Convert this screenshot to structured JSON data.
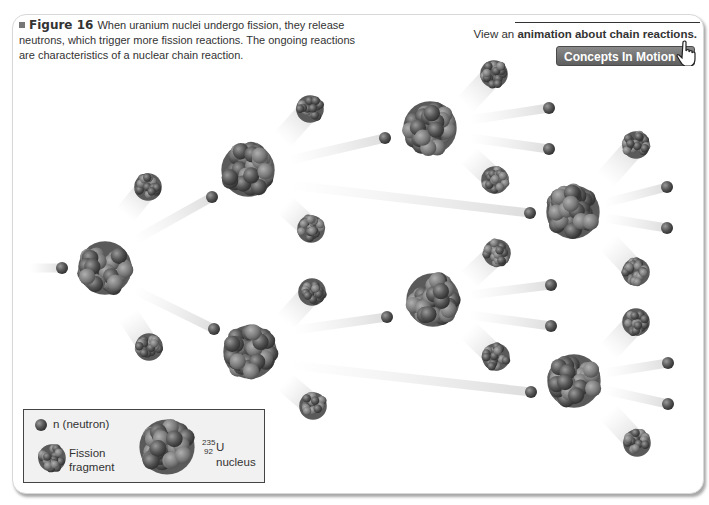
{
  "figure": {
    "label": "Figure 16",
    "caption": "When uranium nuclei undergo fission, they release neutrons, which trigger more fission reactions. The ongoing reactions are characteristics of a nuclear chain reaction."
  },
  "concepts_in_motion": {
    "prefix": "View an ",
    "bold_text": "animation about chain reactions.",
    "button_label": "Concepts In Motion",
    "icon": "hand-pointer-icon"
  },
  "legend": {
    "neutron_label": "n (neutron)",
    "fragment_label_line1": "Fission",
    "fragment_label_line2": "fragment",
    "isotope_mass": "235",
    "isotope_atomic": "92",
    "nucleus_label": "U nucleus"
  },
  "colors": {
    "particle_dark": "#4a4a4a",
    "particle_light": "#8a8a8a",
    "trail": "#e4e4e4",
    "panel_border": "#d8d8d8"
  },
  "diagram": {
    "nuclei": [
      {
        "x": 105,
        "y": 268,
        "r": 29
      },
      {
        "x": 248,
        "y": 170,
        "r": 29
      },
      {
        "x": 250,
        "y": 352,
        "r": 29
      },
      {
        "x": 430,
        "y": 128,
        "r": 29
      },
      {
        "x": 433,
        "y": 300,
        "r": 29
      },
      {
        "x": 573,
        "y": 212,
        "r": 29
      },
      {
        "x": 574,
        "y": 381,
        "r": 29
      }
    ],
    "fragments": [
      {
        "x": 148,
        "y": 187,
        "r": 15,
        "tx": 125,
        "ty": 215
      },
      {
        "x": 149,
        "y": 347,
        "r": 15,
        "tx": 128,
        "ty": 315
      },
      {
        "x": 310,
        "y": 109,
        "r": 15,
        "tx": 282,
        "ty": 140
      },
      {
        "x": 311,
        "y": 229,
        "r": 15,
        "tx": 285,
        "ty": 205
      },
      {
        "x": 312,
        "y": 292,
        "r": 15,
        "tx": 285,
        "ty": 322
      },
      {
        "x": 313,
        "y": 406,
        "r": 15,
        "tx": 285,
        "ty": 382
      },
      {
        "x": 494,
        "y": 74,
        "r": 15,
        "tx": 465,
        "ty": 105
      },
      {
        "x": 495,
        "y": 180,
        "r": 15,
        "tx": 468,
        "ty": 155
      },
      {
        "x": 497,
        "y": 253,
        "r": 15,
        "tx": 468,
        "ty": 280
      },
      {
        "x": 496,
        "y": 357,
        "r": 15,
        "tx": 468,
        "ty": 330
      },
      {
        "x": 636,
        "y": 145,
        "r": 15,
        "tx": 605,
        "ty": 180
      },
      {
        "x": 636,
        "y": 272,
        "r": 15,
        "tx": 608,
        "ty": 242
      },
      {
        "x": 636,
        "y": 322,
        "r": 15,
        "tx": 608,
        "ty": 352
      },
      {
        "x": 637,
        "y": 443,
        "r": 15,
        "tx": 608,
        "ty": 412
      }
    ],
    "neutrons": [
      {
        "x": 62,
        "y": 268,
        "tx": 30,
        "ty": 268
      },
      {
        "x": 212,
        "y": 197,
        "tx": 135,
        "ty": 240
      },
      {
        "x": 214,
        "y": 329,
        "tx": 135,
        "ty": 290
      },
      {
        "x": 385,
        "y": 138,
        "tx": 290,
        "ty": 160
      },
      {
        "x": 387,
        "y": 317,
        "tx": 295,
        "ty": 330
      },
      {
        "x": 549,
        "y": 108,
        "tx": 470,
        "ty": 120
      },
      {
        "x": 549,
        "y": 149,
        "tx": 470,
        "ty": 138
      },
      {
        "x": 530,
        "y": 213,
        "tx": 290,
        "ty": 185
      },
      {
        "x": 551,
        "y": 285,
        "tx": 470,
        "ty": 295
      },
      {
        "x": 551,
        "y": 326,
        "tx": 470,
        "ty": 315
      },
      {
        "x": 531,
        "y": 392,
        "tx": 290,
        "ty": 365
      },
      {
        "x": 667,
        "y": 187,
        "tx": 605,
        "ty": 203
      },
      {
        "x": 667,
        "y": 228,
        "tx": 605,
        "ty": 218
      },
      {
        "x": 668,
        "y": 363,
        "tx": 605,
        "ty": 373
      },
      {
        "x": 668,
        "y": 404,
        "tx": 605,
        "ty": 390
      }
    ]
  }
}
